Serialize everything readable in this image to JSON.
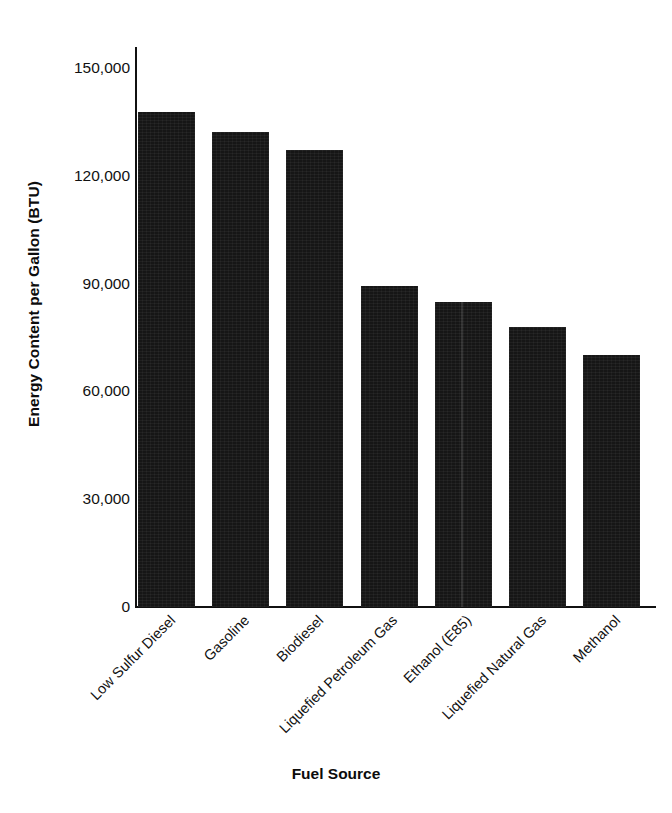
{
  "chart_data": {
    "type": "bar",
    "title": "",
    "xlabel": "Fuel Source",
    "ylabel": "Energy Content per Gallon (BTU)",
    "categories": [
      "Low Sulfur Diesel",
      "Gasoline",
      "Biodiesel",
      "Liquefied Petroleum Gas",
      "Ethanol (E85)",
      "Liquefied Natural Gas",
      "Methanol"
    ],
    "values": [
      137800,
      132200,
      127200,
      89300,
      84900,
      77900,
      70100
    ],
    "ylim": [
      0,
      150000
    ],
    "yticks": [
      0,
      30000,
      60000,
      90000,
      120000,
      150000
    ],
    "ytick_labels": [
      "0",
      "30,000",
      "60,000",
      "90,000",
      "120,000",
      "150,000"
    ],
    "grid": false,
    "legend": "none",
    "bar_color": "#161616",
    "background_color": "#ffffff",
    "axis_color": "#111111"
  }
}
